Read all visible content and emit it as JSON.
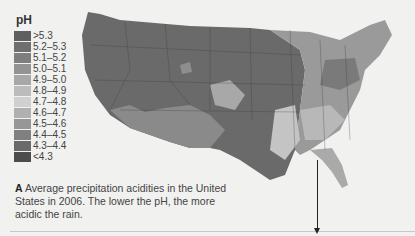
{
  "legend": {
    "title": "pH",
    "items": [
      {
        "label": ">5.3",
        "color": "#5f5f5f"
      },
      {
        "label": "5.2–5.3",
        "color": "#6f6f6f"
      },
      {
        "label": "5.1–5.2",
        "color": "#7e7e7e"
      },
      {
        "label": "5.0–5.1",
        "color": "#939393"
      },
      {
        "label": "4.9–5.0",
        "color": "#a8a8a8"
      },
      {
        "label": "4.8–4.9",
        "color": "#bcbcbc"
      },
      {
        "label": "4.7–4.8",
        "color": "#d0d0d0"
      },
      {
        "label": "4.6–4.7",
        "color": "#b0b0b0"
      },
      {
        "label": "4.5–4.6",
        "color": "#979797"
      },
      {
        "label": "4.4–4.5",
        "color": "#808080"
      },
      {
        "label": "4.3–4.4",
        "color": "#6a6a6a"
      },
      {
        "label": "<4.3",
        "color": "#4c4c4c"
      }
    ]
  },
  "caption": {
    "letter": "A",
    "text": "Average precipitation acidities in the United States in 2006. The lower the pH, the more acidic the rain."
  }
}
